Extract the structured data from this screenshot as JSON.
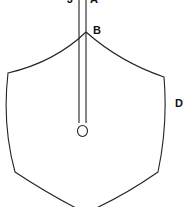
{
  "diagram": {
    "labels": {
      "top_left": "J",
      "top_right": "A",
      "apex": "B",
      "side": "D"
    },
    "colors": {
      "line": "#222222",
      "background": "#ffffff",
      "text": "#111111"
    }
  }
}
